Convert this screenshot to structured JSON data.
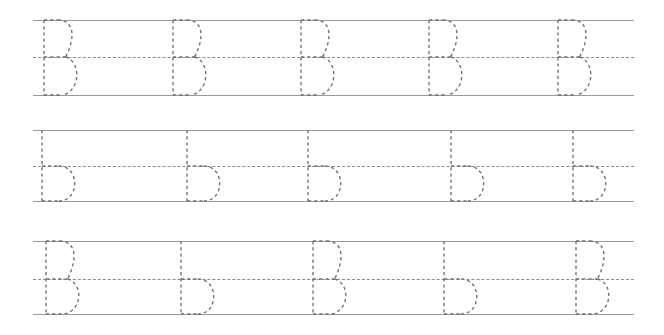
{
  "worksheet": {
    "title": "Letter B Tracing Practice Worksheet",
    "background_color": "#ffffff",
    "width": 664,
    "height": 335,
    "guide_solid_color": "#9a9a9a",
    "guide_dashed_color": "#8d8d8d",
    "glyph_stroke_color": "#6f6f6f",
    "glyph_style": "dashed-outline-trace",
    "letter_practiced": "B",
    "row_count": 3,
    "letters_per_row": 5
  },
  "rows": [
    {
      "row_name": "row-uppercase-b",
      "row_label": "Uppercase B row",
      "top_line_y": 20,
      "mid_line_y": 57,
      "base_line_y": 95,
      "line_start_x": 33,
      "line_end_x": 634,
      "letters": [
        {
          "char": "B",
          "case": "uppercase",
          "x": 43
        },
        {
          "char": "B",
          "case": "uppercase",
          "x": 172
        },
        {
          "char": "B",
          "case": "uppercase",
          "x": 300
        },
        {
          "char": "B",
          "case": "uppercase",
          "x": 428
        },
        {
          "char": "B",
          "case": "uppercase",
          "x": 557
        }
      ]
    },
    {
      "row_name": "row-lowercase-b",
      "row_label": "Lowercase b row",
      "top_line_y": 130,
      "mid_line_y": 166,
      "base_line_y": 201,
      "line_start_x": 33,
      "line_end_x": 634,
      "letters": [
        {
          "char": "b",
          "case": "lowercase",
          "x": 41
        },
        {
          "char": "b",
          "case": "lowercase",
          "x": 186
        },
        {
          "char": "b",
          "case": "lowercase",
          "x": 307
        },
        {
          "char": "b",
          "case": "lowercase",
          "x": 450
        },
        {
          "char": "b",
          "case": "lowercase",
          "x": 572
        }
      ]
    },
    {
      "row_name": "row-mixed-b",
      "row_label": "Mixed uppercase and lowercase B b row",
      "top_line_y": 241,
      "mid_line_y": 279,
      "base_line_y": 314,
      "line_start_x": 33,
      "line_end_x": 634,
      "letters": [
        {
          "char": "B",
          "case": "uppercase",
          "x": 45
        },
        {
          "char": "b",
          "case": "lowercase",
          "x": 180
        },
        {
          "char": "B",
          "case": "uppercase",
          "x": 312
        },
        {
          "char": "b",
          "case": "lowercase",
          "x": 443
        },
        {
          "char": "B",
          "case": "uppercase",
          "x": 575
        }
      ]
    }
  ]
}
